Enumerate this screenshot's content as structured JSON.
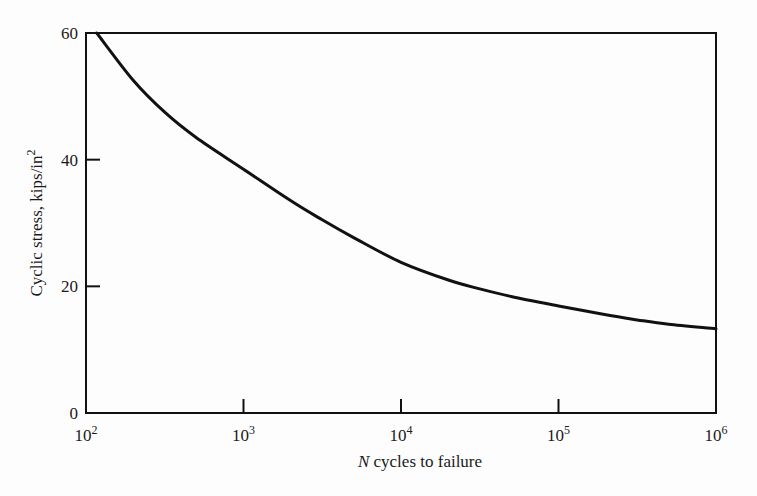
{
  "chart_data": {
    "type": "line",
    "title": "",
    "xlabel_italic": "N",
    "xlabel_rest": " cycles to failure",
    "xlabel": "N cycles to failure",
    "ylabel": "Cycilc stress, kips/in²",
    "ylabel_main": "Cyclic stress, kips/in",
    "ylabel_sup": "2",
    "x_scale": "log",
    "xlim": [
      100,
      1000000
    ],
    "ylim": [
      0,
      60
    ],
    "grid": false,
    "legend": null,
    "x_ticks": [
      {
        "base": "10",
        "exp": "2",
        "value": 100
      },
      {
        "base": "10",
        "exp": "3",
        "value": 1000
      },
      {
        "base": "10",
        "exp": "4",
        "value": 10000
      },
      {
        "base": "10",
        "exp": "5",
        "value": 100000
      },
      {
        "base": "10",
        "exp": "6",
        "value": 1000000
      }
    ],
    "y_ticks": [
      "0",
      "20",
      "40",
      "60"
    ],
    "series": [
      {
        "name": "S-N curve",
        "x": [
          117,
          200,
          316,
          500,
          1000,
          2000,
          3162,
          5000,
          10000,
          20000,
          31623,
          50000,
          100000,
          200000,
          316228,
          500000,
          1000000
        ],
        "y": [
          60,
          52.5,
          47.5,
          43.5,
          38.5,
          33.5,
          30.5,
          27.7,
          23.8,
          21.0,
          19.6,
          18.4,
          16.9,
          15.5,
          14.7,
          14.0,
          13.3
        ]
      }
    ]
  }
}
